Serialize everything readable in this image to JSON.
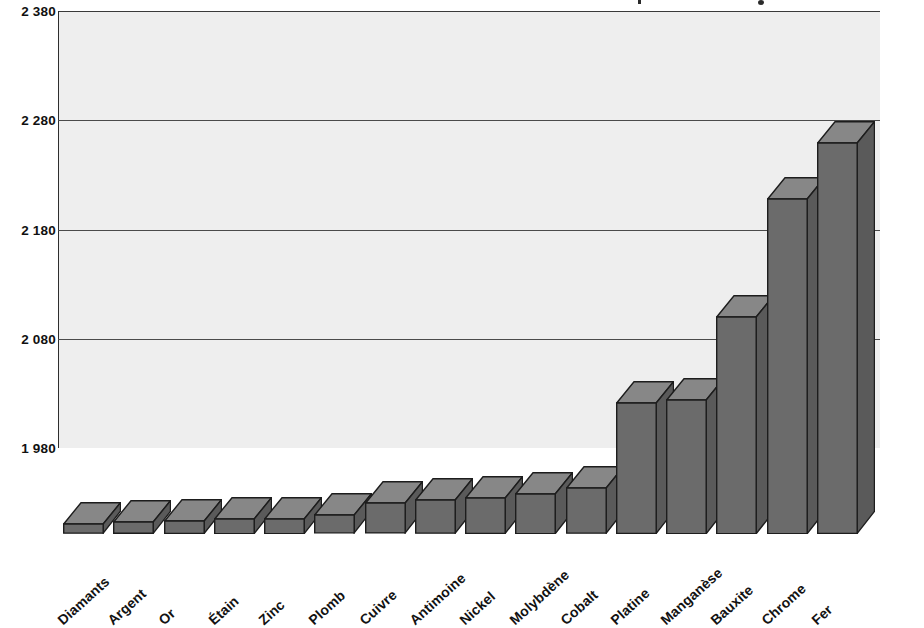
{
  "chart_data": {
    "type": "bar",
    "title": "",
    "xlabel": "",
    "ylabel": "",
    "ylim": [
      1980,
      2380
    ],
    "grid": true,
    "legend": null,
    "yticks": [
      "1 980",
      "2 080",
      "2 180",
      "2 280",
      "2 380"
    ],
    "ytick_values": [
      1980,
      2080,
      2180,
      2280,
      2380
    ],
    "categories": [
      "Diamants",
      "Argent",
      "Or",
      "Étain",
      "Zinc",
      "Plomb",
      "Cuivre",
      "Antimoine",
      "Nickel",
      "Molybdène",
      "Cobalt",
      "Platine",
      "Manganèse",
      "Bauxite",
      "Chrome",
      "Fer"
    ],
    "values": [
      1989,
      1991,
      1992,
      1994,
      1994,
      1997,
      2008,
      2011,
      2013,
      2017,
      2022,
      2100,
      2103,
      2179,
      2287,
      2338
    ],
    "bar_colors": {
      "front": "#6b6b6b",
      "top": "#878787",
      "side": "#5a5a5a",
      "outline": "#1d1d1d"
    },
    "plot_background": "#eeeeee",
    "grid_color": "#4a4a4a",
    "page_background": "#ffffff"
  }
}
